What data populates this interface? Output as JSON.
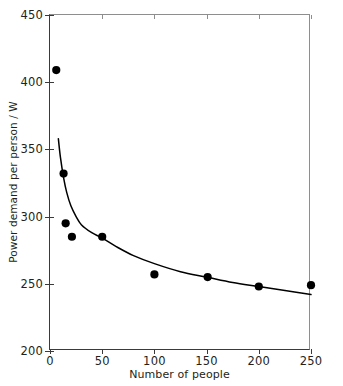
{
  "chart_data": {
    "type": "scatter",
    "title": "",
    "xlabel": "Number of people",
    "ylabel": "Power demand per person / W",
    "xlim": [
      0,
      250
    ],
    "ylim": [
      200,
      450
    ],
    "xticks": [
      0,
      50,
      100,
      150,
      200,
      250
    ],
    "yticks": [
      200,
      250,
      300,
      350,
      400,
      450
    ],
    "xtick_labels": [
      "0",
      "50",
      "100",
      "150",
      "200",
      "250"
    ],
    "ytick_labels": [
      "200",
      "250",
      "300",
      "350",
      "400",
      "450"
    ],
    "grid": false,
    "legend": "none",
    "marker_color": "#000000",
    "line_color": "#000000",
    "points": [
      {
        "x": 6,
        "y": 409
      },
      {
        "x": 13,
        "y": 332
      },
      {
        "x": 15,
        "y": 295
      },
      {
        "x": 21,
        "y": 285
      },
      {
        "x": 50,
        "y": 285
      },
      {
        "x": 100,
        "y": 257
      },
      {
        "x": 151,
        "y": 255
      },
      {
        "x": 200,
        "y": 248
      },
      {
        "x": 250,
        "y": 249
      }
    ],
    "fit_curve": {
      "description": "decreasing power-law fit through the scatter",
      "x_start": 8,
      "x_end": 250,
      "points": [
        {
          "x": 8,
          "y": 358
        },
        {
          "x": 10,
          "y": 344
        },
        {
          "x": 13,
          "y": 329
        },
        {
          "x": 16,
          "y": 318
        },
        {
          "x": 20,
          "y": 308
        },
        {
          "x": 25,
          "y": 300
        },
        {
          "x": 30,
          "y": 294
        },
        {
          "x": 40,
          "y": 288
        },
        {
          "x": 50,
          "y": 284
        },
        {
          "x": 65,
          "y": 277
        },
        {
          "x": 80,
          "y": 271
        },
        {
          "x": 100,
          "y": 265
        },
        {
          "x": 125,
          "y": 259
        },
        {
          "x": 150,
          "y": 255
        },
        {
          "x": 175,
          "y": 251
        },
        {
          "x": 200,
          "y": 248
        },
        {
          "x": 225,
          "y": 245
        },
        {
          "x": 250,
          "y": 242
        }
      ]
    }
  }
}
